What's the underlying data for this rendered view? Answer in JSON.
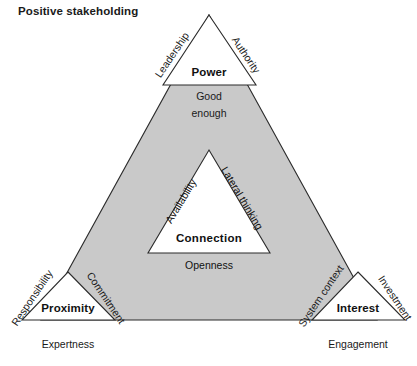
{
  "title": "Positive stakeholding",
  "diagram": {
    "type": "triangle-framework",
    "center": {
      "label": "Connection",
      "edges": {
        "left": "Availability",
        "right": "Lateral thinking",
        "bottom": "Openness"
      }
    },
    "nodes": [
      {
        "id": "power",
        "label": "Power",
        "position": "top",
        "edge_left": "Leadership",
        "edge_right": "Authority",
        "base_label_line1": "Good",
        "base_label_line2": "enough"
      },
      {
        "id": "proximity",
        "label": "Proximity",
        "position": "bottom-left",
        "edge_left": "Responsibility",
        "edge_right": "Commitment",
        "base_label": "Expertness"
      },
      {
        "id": "interest",
        "label": "Interest",
        "position": "bottom-right",
        "edge_left": "System context",
        "edge_right": "Investment",
        "base_label": "Engagement"
      }
    ]
  },
  "colors": {
    "fill_gray": "#c9c9c9",
    "stroke": "#2b2b2b",
    "background": "#ffffff",
    "text": "#1a1a1a"
  }
}
